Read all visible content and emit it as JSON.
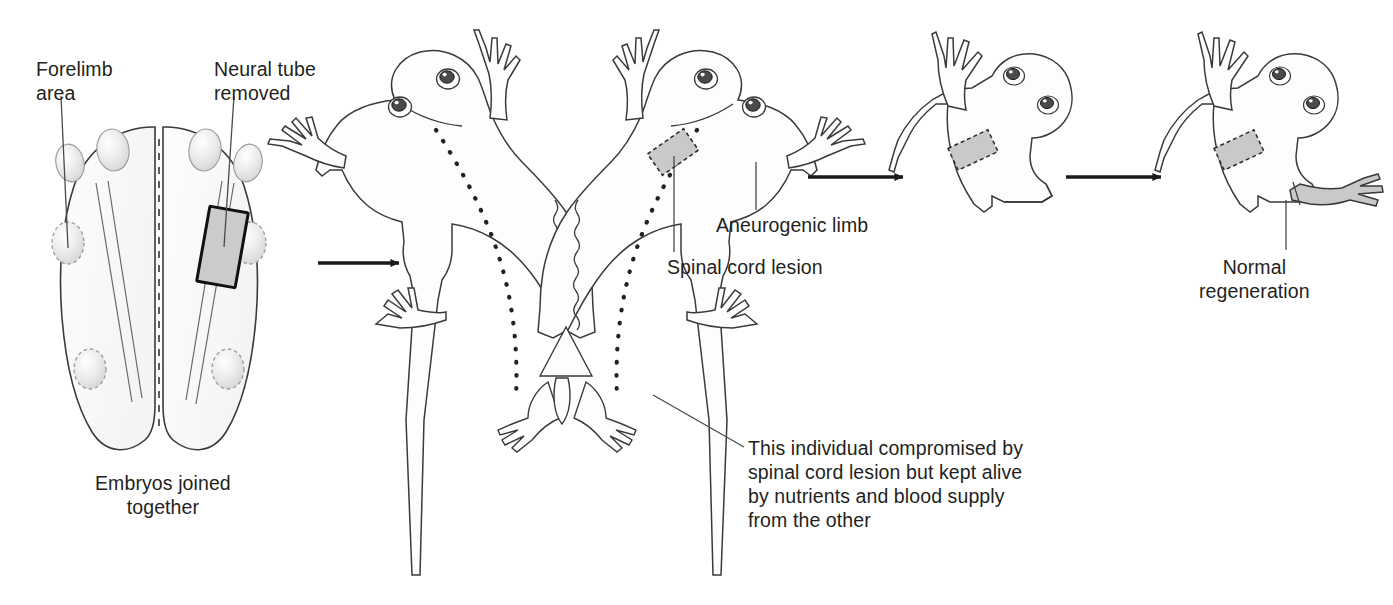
{
  "figure": {
    "background_color": "#ffffff",
    "ink_color": "#231f20",
    "shade_color": "#d4d4d4",
    "body_fill": "#fbfbfb"
  },
  "labels": {
    "forelimb_area": "Forelimb\narea",
    "neural_tube_removed": "Neural tube\nremoved",
    "embryos_joined_together": "Embryos joined\ntogether",
    "aneurogenic_limb": "Aneurogenic limb",
    "spinal_cord_lesion": "Spinal cord lesion",
    "compromised_note": "This individual compromised by\nspinal cord lesion but kept alive\nby nutrients and blood supply\nfrom the other",
    "normal_regeneration": "Normal\nregeneration"
  },
  "panels": [
    {
      "id": "panel-embryos",
      "name": "joined-embryos",
      "caption": "Embryos joined together",
      "features": [
        "left embryo with forelimb area bud",
        "right embryo with neural tube removed block",
        "dashed fusion seam between embryos"
      ]
    },
    {
      "id": "panel-conjoined-larvae",
      "name": "conjoined-larvae",
      "caption": "",
      "features": [
        "two larvae joined at the trunk",
        "dotted spinal cord tracks",
        "shaded spinal cord lesion patch on right larva",
        "aneurogenic forelimb on right larva"
      ]
    },
    {
      "id": "panel-amputated-larva",
      "name": "amputated-larva",
      "caption": "",
      "features": [
        "single larva with shaded lesion patch",
        "forelimb amputated"
      ]
    },
    {
      "id": "panel-regenerated-larva",
      "name": "regenerated-larva",
      "caption": "Normal regeneration",
      "features": [
        "single larva with shaded lesion patch",
        "shaded regenerated forelimb"
      ]
    }
  ],
  "arrows": [
    {
      "name": "arrow-embryos-to-larvae",
      "from": "panel-embryos",
      "to": "panel-conjoined-larvae"
    },
    {
      "name": "arrow-larvae-to-amputated",
      "from": "panel-conjoined-larvae",
      "to": "panel-amputated-larva"
    },
    {
      "name": "arrow-amputated-to-regen",
      "from": "panel-amputated-larva",
      "to": "panel-regenerated-larva"
    }
  ]
}
